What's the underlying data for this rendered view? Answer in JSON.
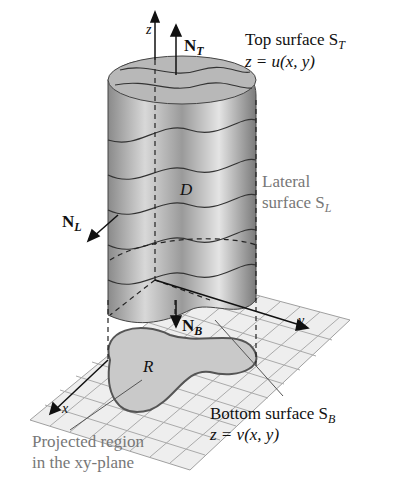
{
  "axes": {
    "z": "z",
    "y": "y",
    "x": "x"
  },
  "normals": {
    "top": {
      "symbol": "N",
      "sub": "T"
    },
    "lateral": {
      "symbol": "N",
      "sub": "L"
    },
    "bottom": {
      "symbol": "N",
      "sub": "B"
    }
  },
  "labels": {
    "top_title": "Top surface S",
    "top_sub": "T",
    "top_eq": "z = u(x, y)",
    "lateral_line1": "Lateral",
    "lateral_line2": "surface S",
    "lateral_sub": "L",
    "solid": "D",
    "region": "R",
    "bottom_title": "Bottom surface S",
    "bottom_sub": "B",
    "bottom_eq": "z = v(x, y)",
    "projected_line1": "Projected region",
    "projected_line2": "in the xy-plane"
  },
  "colors": {
    "grid": "#9a9a9a",
    "region": "#c8c8c8",
    "solid": "#a8a8a8",
    "grey_text": "#777777"
  }
}
